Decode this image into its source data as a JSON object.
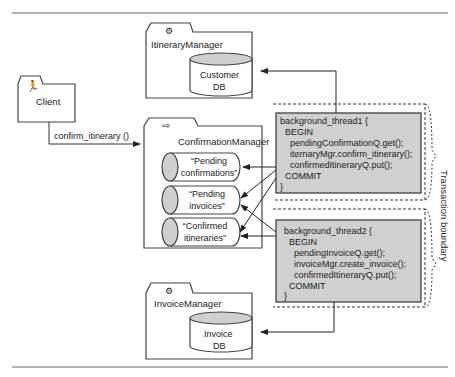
{
  "diagram": {
    "client": {
      "label": "Client",
      "icon": "actor-icon"
    },
    "call": {
      "label": "confirm_itinerary ()"
    },
    "itinerary_manager": {
      "label": "ItineraryManager",
      "icon": "gear-icon",
      "db": [
        "Customer",
        "DB"
      ]
    },
    "confirmation_manager": {
      "label": "ConfirmationManager",
      "icon": "arrow-icon",
      "queues": [
        {
          "line1": "“Pending",
          "line2": "confirmations”"
        },
        {
          "line1": "“Pending",
          "line2": "invoices”"
        },
        {
          "line1": "“Confirmed",
          "line2": "itineraries”"
        }
      ]
    },
    "invoice_manager": {
      "label": "InvoiceManager",
      "icon": "gear-icon",
      "db": [
        "Invoice",
        "DB"
      ]
    },
    "thread1": {
      "lines": [
        "background_thread1 {",
        "BEGIN",
        "pendingConfirmationQ.get();",
        "iternaryMgr.confirm_itinerary();",
        "confirmedItineraryQ.put();",
        "COMMIT",
        "}"
      ]
    },
    "thread2": {
      "lines": [
        "background_thread2 {",
        "BEGIN",
        "pendingInvoiceQ.get();",
        "invoiceMgr.create_invoice();",
        "confirmedItineraryQ.put();",
        "COMMIT",
        "}"
      ]
    },
    "boundary_label": "Transaction boundary",
    "colors": {
      "code_box": "#d0d0d0",
      "db_top": "#cfcfcf",
      "line": "#333333"
    }
  }
}
